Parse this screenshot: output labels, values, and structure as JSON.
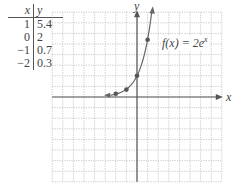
{
  "table": {
    "headers": {
      "x": "x",
      "y": "y"
    },
    "rows": [
      {
        "x": "1",
        "y": "5.4"
      },
      {
        "x": "0",
        "y": "2"
      },
      {
        "x": "−1",
        "y": "0.7"
      },
      {
        "x": "−2",
        "y": "0.3"
      }
    ]
  },
  "function_label": {
    "base": "f(x) = 2e",
    "exponent": "x"
  },
  "axes": {
    "x_label": "x",
    "y_label": "y"
  },
  "colors": {
    "grid": "#bdbdbd",
    "axis": "#555555",
    "curve": "#666666",
    "point": "#555555"
  },
  "chart_data": {
    "type": "line",
    "xlabel": "x",
    "ylabel": "y",
    "xlim": [
      -8,
      8
    ],
    "ylim": [
      -8,
      8
    ],
    "grid": true,
    "series": [
      {
        "name": "f(x) = 2e^x",
        "x": [
          -2.5,
          -2,
          -1,
          0,
          1,
          1.4
        ],
        "values": [
          0.16,
          0.27,
          0.74,
          2,
          5.44,
          8.1
        ]
      }
    ],
    "points": [
      {
        "x": -2,
        "y": 0.3
      },
      {
        "x": -1,
        "y": 0.7
      },
      {
        "x": 0,
        "y": 2
      },
      {
        "x": 1,
        "y": 5.4
      }
    ],
    "table": {
      "columns": [
        "x",
        "y"
      ],
      "rows": [
        [
          1,
          5.4
        ],
        [
          0,
          2
        ],
        [
          -1,
          0.7
        ],
        [
          -2,
          0.3
        ]
      ]
    }
  }
}
